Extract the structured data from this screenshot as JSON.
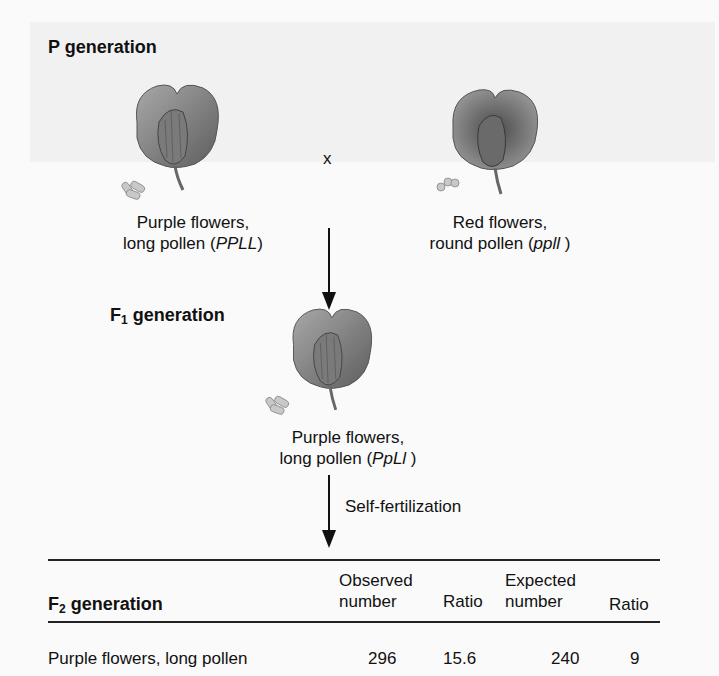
{
  "figure": {
    "p_generation": {
      "heading": "P generation",
      "cross_symbol": "x",
      "parent_left": {
        "line1": "Purple flowers,",
        "line2_prefix": "long pollen (",
        "genotype": "PPLL",
        "line2_suffix": ")",
        "flower_icon": "purple-flower",
        "pollen_icon": "long-pollen"
      },
      "parent_right": {
        "line1": "Red flowers,",
        "line2_prefix": "round pollen (",
        "genotype": "ppll",
        "line2_suffix": " )",
        "flower_icon": "red-flower",
        "pollen_icon": "round-pollen"
      }
    },
    "f1_generation": {
      "heading_prefix": "F",
      "heading_sub": "1",
      "heading_suffix": " generation",
      "offspring": {
        "line1": "Purple flowers,",
        "line2_prefix": "long pollen (",
        "genotype": "PpLl",
        "line2_suffix": " )"
      },
      "process_label": "Self-fertilization"
    },
    "f2_table": {
      "heading_prefix": "F",
      "heading_sub": "2",
      "heading_suffix": " generation",
      "columns": [
        {
          "line1": "Observed",
          "line2": "number"
        },
        {
          "line1": "",
          "line2": "Ratio"
        },
        {
          "line1": "Expected",
          "line2": "number"
        },
        {
          "line1": "",
          "line2": "Ratio"
        }
      ],
      "rows": [
        {
          "phenotype": "Purple flowers, long pollen",
          "observed": "296",
          "observed_ratio": "15.6",
          "expected": "240",
          "expected_ratio": "9"
        }
      ]
    }
  },
  "colors": {
    "text": "#111111",
    "background": "#fafafa",
    "flower_gray": "#7a7a7a",
    "pollen_gray": "#c8c8c8"
  }
}
